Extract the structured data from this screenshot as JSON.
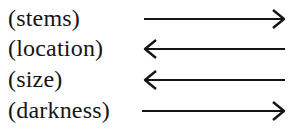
{
  "diagram": {
    "rows": [
      {
        "label": "(stems)",
        "direction": "right"
      },
      {
        "label": "(location)",
        "direction": "left"
      },
      {
        "label": "(size)",
        "direction": "left"
      },
      {
        "label": "(darkness)",
        "direction": "right"
      }
    ],
    "colors": {
      "ink": "#151515",
      "background": "#ffffff"
    }
  }
}
